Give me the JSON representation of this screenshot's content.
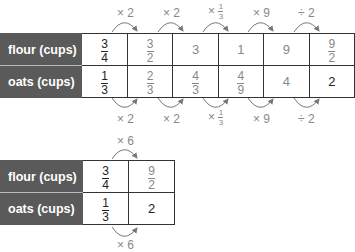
{
  "top_table": {
    "rows": [
      {
        "label": "flour (cups)",
        "cells": [
          {
            "type": "frac",
            "num": "3",
            "den": "4",
            "gray": false
          },
          {
            "type": "frac",
            "num": "3",
            "den": "2",
            "gray": true
          },
          {
            "type": "int",
            "val": "3",
            "gray": true
          },
          {
            "type": "int",
            "val": "1",
            "gray": true
          },
          {
            "type": "int",
            "val": "9",
            "gray": true
          },
          {
            "type": "frac",
            "num": "9",
            "den": "2",
            "gray": true
          }
        ]
      },
      {
        "label": "oats (cups)",
        "cells": [
          {
            "type": "frac",
            "num": "1",
            "den": "3",
            "gray": false
          },
          {
            "type": "frac",
            "num": "2",
            "den": "3",
            "gray": true
          },
          {
            "type": "frac",
            "num": "4",
            "den": "3",
            "gray": true
          },
          {
            "type": "frac",
            "num": "4",
            "den": "9",
            "gray": true
          },
          {
            "type": "int",
            "val": "4",
            "gray": true
          },
          {
            "type": "int",
            "val": "2",
            "gray": false
          }
        ]
      }
    ],
    "ops_top": [
      "× 2",
      "× 2",
      "× 1/3",
      "× 9",
      "÷ 2"
    ],
    "ops_bottom": [
      "× 2",
      "× 2",
      "× 1/3",
      "× 9",
      "÷ 2"
    ]
  },
  "bottom_table": {
    "rows": [
      {
        "label": "flour (cups)",
        "c1n": "3",
        "c1d": "4",
        "c2n": "9",
        "c2d": "2"
      },
      {
        "label": "oats (cups)",
        "c1n": "1",
        "c1d": "3",
        "c2": "2"
      }
    ],
    "op_top": "× 6",
    "op_bottom": "× 6"
  },
  "labels": {
    "op_x2": "× 2",
    "op_x": "×",
    "op_one": "1",
    "op_three": "3",
    "op_x9": "× 9",
    "op_div2": "÷ 2"
  }
}
